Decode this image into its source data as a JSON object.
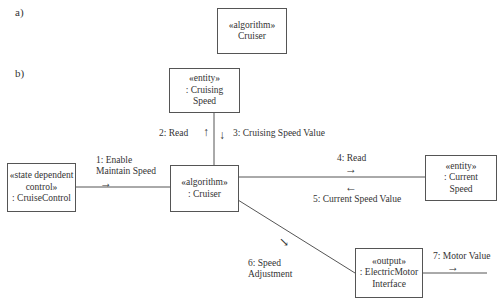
{
  "parts": {
    "a": "a)",
    "b": "b)"
  },
  "part_a": {
    "cruiser": {
      "stereotype": "«algorithm»",
      "name": "Cruiser"
    }
  },
  "part_b": {
    "objects": {
      "cruising_speed": {
        "stereotype": "«entity»",
        "line1": ": Cruising",
        "line2": "Speed"
      },
      "cruise_control": {
        "stereotype1": "«state dependent",
        "stereotype2": "control»",
        "name": ": CruiseControl"
      },
      "cruiser": {
        "stereotype": "«algorithm»",
        "name": ": Cruiser"
      },
      "current_speed": {
        "stereotype": "«entity»",
        "line1": ": Current",
        "line2": "Speed"
      },
      "electric_motor": {
        "stereotype": "«output»",
        "line1": ": ElectricMotor",
        "line2": "Interface"
      }
    },
    "messages": {
      "m1_line1": "1: Enable",
      "m1_line2": "Maintain Speed",
      "m2": "2: Read",
      "m3": "3: Cruising Speed Value",
      "m4": "4: Read",
      "m5": "5: Current Speed Value",
      "m6_line1": "6: Speed",
      "m6_line2": "Adjustment",
      "m7": "7: Motor Value"
    },
    "arrows": {
      "right": "→",
      "left": "←",
      "up": "↑",
      "down": "↓",
      "diag": "↘"
    }
  }
}
